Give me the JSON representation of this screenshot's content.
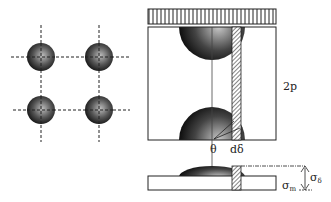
{
  "diagram": {
    "labels": {
      "period": "2p",
      "theta": "θ",
      "d_delta": "dδ",
      "sigma_m": "σ",
      "sigma_m_sub": "m",
      "sigma_delta": "σ",
      "sigma_delta_sub": "δ"
    },
    "grid_particles": 4
  }
}
